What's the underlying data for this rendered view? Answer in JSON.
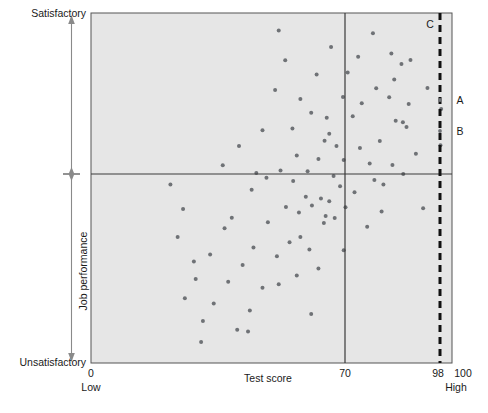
{
  "chart_data": {
    "type": "scatter",
    "title": "",
    "xlabel": "Test score",
    "ylabel": "Job performance",
    "xlim": [
      0,
      100
    ],
    "ylim": [
      0,
      100
    ],
    "grid": false,
    "legend": null,
    "x_axis": {
      "label": "Test score",
      "ticks": [
        {
          "value": 0,
          "label": "0"
        },
        {
          "value": 70,
          "label": "70"
        },
        {
          "value": 98,
          "label": "98"
        },
        {
          "value": 100,
          "label": "100"
        }
      ],
      "end_labels": {
        "left": "Low",
        "right": "High"
      }
    },
    "y_axis": {
      "label": "Job performance",
      "end_labels": {
        "top": "Satisfactory",
        "bottom": "Unsatisfactory"
      },
      "cutoff": 50
    },
    "reference_lines": [
      {
        "name": "test-cutoff-line",
        "orientation": "vertical",
        "value": 70,
        "style": "solid",
        "label": "70"
      },
      {
        "name": "performance-cutoff-line",
        "orientation": "horizontal",
        "value": 50,
        "style": "solid",
        "label": ""
      },
      {
        "name": "selection-line",
        "orientation": "vertical",
        "value": 98,
        "style": "dashed",
        "label": "98"
      }
    ],
    "annotations": [
      {
        "name": "annotation-c",
        "label": "C",
        "x": 95.5,
        "y": 98
      },
      {
        "name": "annotation-a",
        "label": "A",
        "x": 101.5,
        "y": 75
      },
      {
        "name": "annotation-b",
        "label": "B",
        "x": 101.5,
        "y": 65
      }
    ],
    "point_color": "#6f7276",
    "plot_background": "#e6e6e6",
    "points": [
      [
        52.0,
        95.0
      ],
      [
        66.5,
        90.3
      ],
      [
        78.1,
        94.2
      ],
      [
        53.8,
        86.5
      ],
      [
        74.0,
        87.5
      ],
      [
        83.2,
        88.4
      ],
      [
        88.5,
        86.6
      ],
      [
        86.0,
        85.4
      ],
      [
        71.1,
        83.0
      ],
      [
        62.5,
        82.4
      ],
      [
        84.0,
        81.0
      ],
      [
        79.0,
        78.5
      ],
      [
        51.0,
        78.0
      ],
      [
        93.2,
        78.6
      ],
      [
        69.8,
        76.0
      ],
      [
        82.6,
        75.9
      ],
      [
        58.0,
        75.4
      ],
      [
        75.0,
        74.2
      ],
      [
        88.0,
        74.0
      ],
      [
        97.0,
        72.6
      ],
      [
        61.0,
        71.5
      ],
      [
        65.3,
        70.1
      ],
      [
        72.5,
        70.5
      ],
      [
        84.4,
        69.2
      ],
      [
        86.4,
        68.8
      ],
      [
        87.4,
        67.4
      ],
      [
        55.8,
        67.0
      ],
      [
        47.5,
        66.5
      ],
      [
        66.0,
        65.5
      ],
      [
        64.7,
        63.5
      ],
      [
        80.0,
        63.4
      ],
      [
        68.0,
        62.0
      ],
      [
        96.8,
        62.2
      ],
      [
        74.5,
        61.4
      ],
      [
        90.0,
        59.8
      ],
      [
        57.0,
        59.3
      ],
      [
        63.0,
        58.3
      ],
      [
        70.0,
        58.0
      ],
      [
        77.2,
        57.0
      ],
      [
        83.5,
        56.6
      ],
      [
        52.5,
        55.0
      ],
      [
        60.0,
        54.8
      ],
      [
        45.8,
        54.3
      ],
      [
        86.5,
        54.0
      ],
      [
        67.2,
        53.4
      ],
      [
        48.6,
        52.9
      ],
      [
        78.5,
        52.3
      ],
      [
        56.0,
        52.0
      ],
      [
        81.0,
        51.0
      ],
      [
        69.0,
        50.5
      ],
      [
        73.0,
        48.8
      ],
      [
        59.5,
        47.5
      ],
      [
        63.7,
        47.0
      ],
      [
        66.0,
        46.2
      ],
      [
        61.2,
        45.0
      ],
      [
        54.0,
        44.6
      ],
      [
        70.5,
        44.5
      ],
      [
        92.0,
        44.2
      ],
      [
        57.6,
        43.0
      ],
      [
        80.5,
        43.3
      ],
      [
        65.0,
        42.0
      ],
      [
        67.5,
        41.4
      ],
      [
        49.0,
        40.2
      ],
      [
        64.5,
        40.0
      ],
      [
        37.0,
        38.5
      ],
      [
        76.5,
        38.9
      ],
      [
        58.0,
        36.0
      ],
      [
        55.0,
        34.5
      ],
      [
        45.0,
        33.0
      ],
      [
        60.5,
        32.4
      ],
      [
        70.0,
        32.2
      ],
      [
        33.0,
        31.0
      ],
      [
        51.5,
        30.5
      ],
      [
        42.0,
        28.0
      ],
      [
        63.0,
        27.0
      ],
      [
        57.0,
        25.0
      ],
      [
        29.0,
        24.0
      ],
      [
        38.0,
        23.2
      ],
      [
        52.0,
        22.5
      ],
      [
        47.5,
        21.5
      ],
      [
        26.0,
        18.5
      ],
      [
        34.0,
        17.0
      ],
      [
        44.0,
        15.0
      ],
      [
        61.0,
        14.0
      ],
      [
        31.0,
        12.0
      ],
      [
        40.5,
        9.5
      ],
      [
        43.5,
        9.0
      ],
      [
        30.5,
        6.0
      ],
      [
        22.0,
        51.0
      ],
      [
        25.5,
        44.0
      ],
      [
        24.0,
        36.0
      ],
      [
        28.5,
        29.0
      ],
      [
        41.0,
        62.0
      ],
      [
        36.5,
        56.5
      ],
      [
        44.5,
        49.5
      ],
      [
        39.0,
        41.5
      ]
    ]
  }
}
